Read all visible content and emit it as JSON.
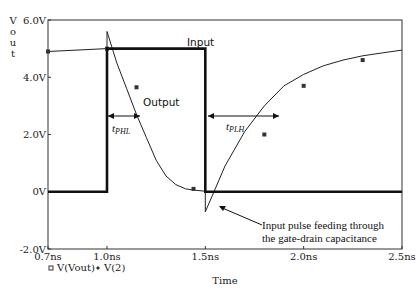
{
  "chart_data": {
    "type": "line",
    "title": "",
    "xlabel": "Time",
    "ylabel": "Vout",
    "xlim": [
      0.7,
      2.5
    ],
    "ylim": [
      -2.0,
      6.0
    ],
    "x_unit": "ns",
    "y_unit": "V",
    "x_ticks": [
      "0.7ns",
      "1.0ns",
      "1.5ns",
      "2.0ns",
      "2.5ns"
    ],
    "y_ticks": [
      "6.0V",
      "4.0V",
      "2.0V",
      "0V",
      "-2.0V"
    ],
    "grid": false,
    "legend": {
      "position": "below-left",
      "entries": [
        {
          "marker": "square",
          "label": "V(Vout)"
        },
        {
          "marker": "diamond",
          "label": "V(2)"
        }
      ]
    },
    "series": [
      {
        "name": "V(Vout)",
        "label": "Output",
        "x": [
          0.7,
          1.0,
          1.0,
          1.05,
          1.1,
          1.15,
          1.2,
          1.25,
          1.3,
          1.35,
          1.4,
          1.45,
          1.5,
          1.5,
          1.55,
          1.6,
          1.7,
          1.8,
          1.9,
          2.0,
          2.1,
          2.2,
          2.3,
          2.4,
          2.5
        ],
        "values": [
          4.9,
          5.0,
          5.6,
          4.5,
          3.6,
          2.7,
          1.9,
          1.1,
          0.55,
          0.25,
          0.1,
          0.05,
          0.02,
          -0.7,
          0.1,
          0.9,
          2.1,
          3.0,
          3.7,
          4.1,
          4.4,
          4.6,
          4.75,
          4.85,
          4.95
        ]
      },
      {
        "name": "V(2)",
        "label": "Input",
        "x": [
          0.7,
          1.0,
          1.0,
          1.5,
          1.5,
          2.5
        ],
        "values": [
          0,
          0,
          5.0,
          5.0,
          0,
          0
        ]
      }
    ],
    "annotations": [
      {
        "text": "Input",
        "x": 1.28,
        "y": 5.3
      },
      {
        "text": "Output",
        "x": 1.13,
        "y": 3.0
      },
      {
        "text": "t_PHL",
        "type": "interval",
        "x_start": 1.0,
        "x_end": 1.17,
        "y": 2.5
      },
      {
        "text": "t_PLH",
        "type": "interval",
        "x_start": 1.5,
        "x_end": 1.82,
        "y": 2.5
      },
      {
        "text": "Input pulse feeding through the gate-drain capacitance",
        "arrow_to": {
          "x": 1.55,
          "y": -0.45
        }
      }
    ]
  },
  "labels": {
    "y_axis_title": "Vout",
    "x_axis_title": "Time",
    "input_label": "Input",
    "output_label": "Output",
    "tphl_main": "t",
    "tphl_sub": "PHL",
    "tplh_main": "t",
    "tplh_sub": "PLH",
    "annotation_line1": "Input pulse feeding through",
    "annotation_line2": "the gate-drain capacitance",
    "legend_vout": "V(Vout)",
    "legend_v2": "V(2)"
  }
}
